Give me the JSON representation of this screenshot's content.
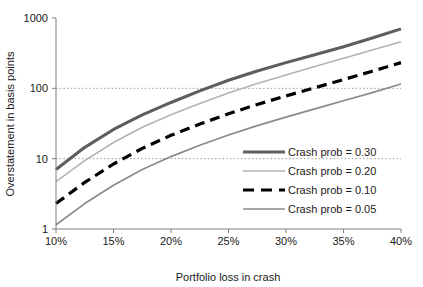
{
  "chart_data": {
    "type": "line",
    "title": "",
    "xlabel": "Portfolio loss in crash",
    "ylabel": "Overstatement in basis points",
    "yscale": "log",
    "ylim": [
      1,
      1000
    ],
    "xlim": [
      10,
      40
    ],
    "grid": "horizontal-dotted-at-10-and-100",
    "legend_position": "inside-right-middle",
    "x_tick_labels": [
      "10%",
      "15%",
      "20%",
      "25%",
      "30%",
      "35%",
      "40%"
    ],
    "x_ticks": [
      10,
      15,
      20,
      25,
      30,
      35,
      40
    ],
    "y_tick_labels": [
      "1000",
      "100",
      "10",
      "1"
    ],
    "y_ticks": [
      1000,
      100,
      10,
      1
    ],
    "x": [
      10,
      12.5,
      15,
      17.5,
      20,
      22.5,
      25,
      27.5,
      30,
      32.5,
      35,
      37.5,
      40
    ],
    "series": [
      {
        "name": "Crash prob = 0.30",
        "label": "Crash prob = 0.30",
        "color": "#5e5e5e",
        "width": 3.1,
        "dash": "none",
        "values": [
          7.0,
          14.5,
          26.0,
          42.0,
          63.0,
          92.0,
          130.0,
          176.0,
          232.0,
          300.0,
          390.0,
          520.0,
          700.0
        ]
      },
      {
        "name": "Crash prob = 0.20",
        "label": "Crash prob = 0.20",
        "color": "#b3b3b3",
        "width": 1.6,
        "dash": "none",
        "values": [
          4.7,
          9.4,
          17.0,
          28.0,
          42.0,
          61.0,
          86.0,
          117.0,
          155.0,
          205.0,
          268.0,
          350.0,
          460.0
        ]
      },
      {
        "name": "Crash prob = 0.10",
        "label": "Crash prob = 0.10",
        "color": "#000000",
        "width": 3.2,
        "dash": "10 6",
        "values": [
          2.3,
          4.6,
          8.4,
          14.0,
          21.5,
          31.0,
          43.5,
          59.0,
          78.0,
          102.0,
          133.0,
          175.0,
          232.0
        ]
      },
      {
        "name": "Crash prob = 0.05",
        "label": "Crash prob = 0.05",
        "color": "#8a8a8a",
        "width": 1.7,
        "dash": "none",
        "values": [
          1.15,
          2.3,
          4.2,
          7.0,
          10.7,
          15.5,
          21.7,
          29.5,
          39.0,
          51.0,
          66.5,
          87.0,
          115.0
        ]
      }
    ]
  },
  "axes": {
    "x_title": "Portfolio loss in crash",
    "y_title": "Overstatement in basis points"
  }
}
